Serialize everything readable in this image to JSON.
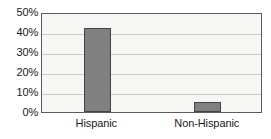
{
  "chart_data": {
    "type": "bar",
    "title": "",
    "subtitle": "",
    "xlabel": "",
    "ylabel": "",
    "categories": [
      "Hispanic",
      "Non-Hispanic"
    ],
    "values": [
      42,
      5
    ],
    "series": [
      {
        "name": "",
        "values": [
          42,
          5
        ]
      }
    ],
    "ylim": [
      0,
      50
    ],
    "y_ticks": [
      0,
      10,
      20,
      30,
      40,
      50
    ],
    "y_tick_labels": [
      "0%",
      "10%",
      "20%",
      "30%",
      "40%",
      "50%"
    ],
    "grid": true,
    "grid_axis": "y",
    "legend": false,
    "legend_position": "none",
    "value_format": "percent",
    "colors": {
      "bar_fill": "#808080",
      "bar_border": "#444444",
      "plot_background": "#f6f6f4",
      "plot_border": "#5a5a5a",
      "gridline": "#c9c9c9",
      "text": "#1a1a1a",
      "page_background": "#ffffff"
    }
  }
}
